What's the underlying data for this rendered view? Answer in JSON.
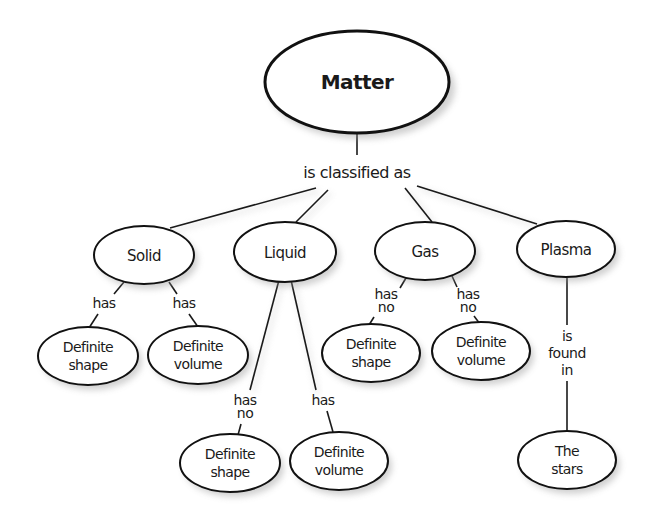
{
  "diagram": {
    "type": "concept-map",
    "root": {
      "label": "Matter"
    },
    "root_relation": "is classified as",
    "states": [
      {
        "label": "Solid",
        "children": [
          {
            "relation": [
              "has"
            ],
            "label": [
              "Definite",
              "shape"
            ]
          },
          {
            "relation": [
              "has"
            ],
            "label": [
              "Definite",
              "volume"
            ]
          }
        ]
      },
      {
        "label": "Liquid",
        "children": [
          {
            "relation": [
              "has",
              "no"
            ],
            "label": [
              "Definite",
              "shape"
            ]
          },
          {
            "relation": [
              "has"
            ],
            "label": [
              "Definite",
              "volume"
            ]
          }
        ]
      },
      {
        "label": "Gas",
        "children": [
          {
            "relation": [
              "has",
              "no"
            ],
            "label": [
              "Definite",
              "shape"
            ]
          },
          {
            "relation": [
              "has",
              "no"
            ],
            "label": [
              "Definite",
              "volume"
            ]
          }
        ]
      },
      {
        "label": "Plasma",
        "children": [
          {
            "relation": [
              "is",
              "found",
              "in"
            ],
            "label": [
              "The",
              "stars"
            ]
          }
        ]
      }
    ]
  },
  "colors": {
    "background": "#ffffff",
    "stroke": "#111111",
    "text": "#1a1a1a"
  }
}
